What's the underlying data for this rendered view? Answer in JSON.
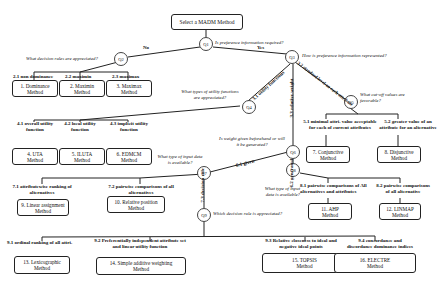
{
  "root": {
    "label": "Select a MADM Method"
  },
  "questions": {
    "q1": {
      "id": "Q1",
      "text": "Is preference information required?"
    },
    "q2": {
      "id": "Q2",
      "text": "What decision rules are appreciated?"
    },
    "q3": {
      "id": "Q3",
      "text": "How is preference information represented?"
    },
    "q4": {
      "id": "Q4",
      "text": "What types of utility functions are appreciated?"
    },
    "q5": {
      "id": "Q5",
      "text": "What cut-off values are favorable?"
    },
    "q6": {
      "id": "Q6",
      "text": "Is weight given beforehand or will it be generated?"
    },
    "q7": {
      "id": "Q7",
      "text": "What type of input data is available?"
    },
    "q8": {
      "id": "Q8",
      "text": "What type of input data is available?"
    },
    "q9": {
      "id": "Q9",
      "text": "Which decision rule is appreciated?"
    }
  },
  "edges": {
    "no": "No",
    "yes": "Yes",
    "e31": "3.1 utility functions",
    "e32": "3.2 standard level on each attribute",
    "e33": "3.3 relative weight",
    "e61": "6.1 given",
    "e62": "6.2 generated",
    "e73": "7.3 decision rule"
  },
  "branches": {
    "b21": "2.1 non dominance",
    "b22": "2.2 maximin",
    "b23": "2.3 maximax",
    "b41": "4.1 overall utility function",
    "b42": "4.2 local utility function",
    "b43": "4.3 implicit utility function",
    "b51": "5.1 minimal attri. value acceptable for each of current attributes",
    "b52": "5.2 greater value of an attribute for an alternative",
    "b71": "7.1 attributewise ranking of alternatives",
    "b72": "7.2 pairwise comparisons of all alternatives",
    "b81": "8.1 pairwise comparisons of All alternatives and attributes",
    "b82": "8.2 pairwise comparisons of all alternative",
    "b91": "9.1 ordinal ranking of all attri.",
    "b92": "9.2 Preferentially independent attribute set and linear utility function",
    "b93": "9.3 Relative closeness to ideal and negative ideal points",
    "b94": "9.4 concordance and discordance dominance indices"
  },
  "methods": {
    "m1": {
      "line1": "1. Dominance",
      "line2": "Method"
    },
    "m2": {
      "line1": "2. Maximin",
      "line2": "Method"
    },
    "m3": {
      "line1": "3. Maximax",
      "line2": "Method"
    },
    "m4": {
      "line1": "4. UTA",
      "line2": "Method"
    },
    "m5": {
      "line1": "5. ILUTA",
      "line2": "Method"
    },
    "m6": {
      "line1": "6. EDMCM",
      "line2": "Method"
    },
    "m7": {
      "line1": "7. Conjunctive",
      "line2": "Method"
    },
    "m8": {
      "line1": "8. Disjunctive",
      "line2": "Method"
    },
    "m9": {
      "line1": "9. Linear assignment",
      "line2": "Method"
    },
    "m10": {
      "line1": "10. Relative position",
      "line2": "Method"
    },
    "m11": {
      "line1": "11. AHP",
      "line2": "Method"
    },
    "m12": {
      "line1": "12. LINMAP",
      "line2": "Method"
    },
    "m13": {
      "line1": "13. Lexicographic",
      "line2": "Method"
    },
    "m14": {
      "line1": "14. Simple additive weighting",
      "line2": "Method"
    },
    "m15": {
      "line1": "15. TOPSIS",
      "line2": "Method"
    },
    "m16": {
      "line1": "16. ELECTRE",
      "line2": "Method"
    }
  }
}
